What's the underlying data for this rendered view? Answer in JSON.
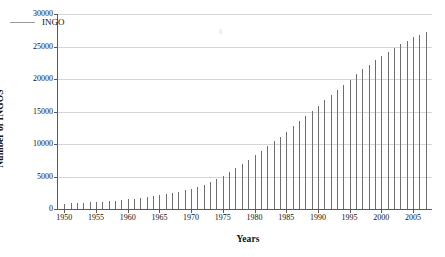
{
  "chart_data": {
    "type": "bar",
    "title": "",
    "subtitle": "",
    "xlabel": "Years",
    "ylabel": "Number of INGOS",
    "xlim": [
      1949,
      2008
    ],
    "ylim": [
      0,
      30000
    ],
    "grid": "horizontal",
    "legend_position": "top-left-inside",
    "series": [
      {
        "name": "INGO",
        "color": "#6e6e6e",
        "categories": [
          1950,
          1951,
          1952,
          1953,
          1954,
          1955,
          1956,
          1957,
          1958,
          1959,
          1960,
          1961,
          1962,
          1963,
          1964,
          1965,
          1966,
          1967,
          1968,
          1969,
          1970,
          1971,
          1972,
          1973,
          1974,
          1975,
          1976,
          1977,
          1978,
          1979,
          1980,
          1981,
          1982,
          1983,
          1984,
          1985,
          1986,
          1987,
          1988,
          1989,
          1990,
          1991,
          1992,
          1993,
          1994,
          1995,
          1996,
          1997,
          1998,
          1999,
          2000,
          2001,
          2002,
          2003,
          2004,
          2005,
          2006,
          2007
        ],
        "values": [
          800,
          850,
          900,
          960,
          1020,
          1080,
          1150,
          1220,
          1300,
          1390,
          1480,
          1580,
          1690,
          1810,
          1940,
          2080,
          2240,
          2420,
          2620,
          2850,
          3100,
          3400,
          3750,
          4150,
          4600,
          5100,
          5650,
          6250,
          6900,
          7600,
          8300,
          9000,
          9700,
          10400,
          11100,
          11900,
          12700,
          13500,
          14300,
          15100,
          15900,
          16700,
          17500,
          18300,
          19100,
          19900,
          20700,
          21500,
          22200,
          22900,
          23600,
          24200,
          24800,
          25400,
          25900,
          26400,
          26800,
          27200
        ]
      }
    ],
    "y_ticks": [
      0,
      5000,
      10000,
      15000,
      20000,
      25000,
      30000
    ],
    "x_ticks": [
      1950,
      1955,
      1960,
      1965,
      1970,
      1975,
      1980,
      1985,
      1990,
      1995,
      2000,
      2005
    ],
    "legend_entries": [
      {
        "label": "INGO",
        "marker": "line",
        "color": "#9a9a9a"
      }
    ]
  },
  "axes": {
    "y_title": "Number of INGOS",
    "x_title": "Years",
    "y_tick_labels": [
      "0",
      "5000",
      "10000",
      "15000",
      "20000",
      "25000",
      "30000"
    ],
    "x_tick_labels": [
      "1950",
      "1955",
      "1960",
      "1965",
      "1970",
      "1975",
      "1980",
      "1985",
      "1990",
      "1995",
      "2000",
      "2005"
    ]
  },
  "legend": {
    "items": [
      {
        "label": "INGO"
      }
    ]
  },
  "colors": {
    "bar": "#6e6e6e",
    "grid": "#d6d6d6",
    "axis": "#5a5a5a",
    "legend_line": "#9a9a9a",
    "background": "#ffffff"
  }
}
